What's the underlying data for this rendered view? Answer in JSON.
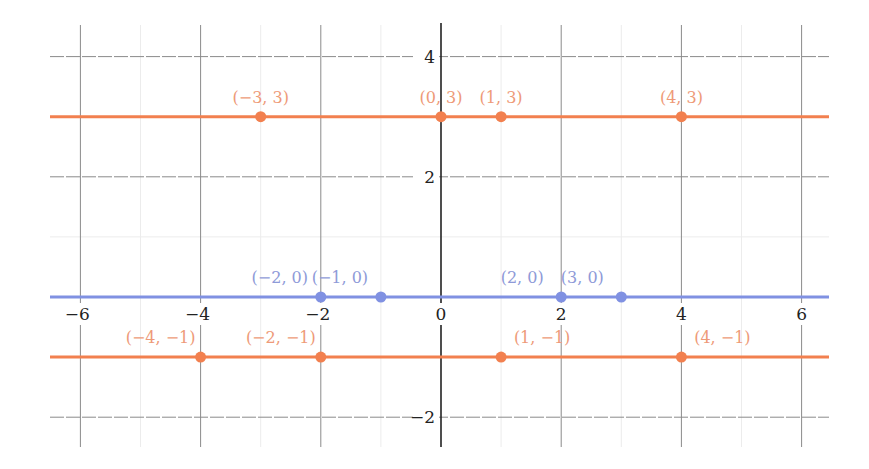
{
  "chart_data": {
    "type": "line",
    "title": "",
    "xlabel": "",
    "ylabel": "",
    "xlim": [
      -6.5,
      6.5
    ],
    "ylim": [
      -2.5,
      4.5
    ],
    "grid": true,
    "x_ticks": [
      -6,
      -4,
      -2,
      0,
      2,
      4,
      6
    ],
    "y_ticks": [
      -2,
      2,
      4
    ],
    "x_tick_labels": [
      "−6",
      "−4",
      "−2",
      "0",
      "2",
      "4",
      "6"
    ],
    "y_tick_labels": [
      "−2",
      "2",
      "4"
    ],
    "colors": {
      "orange": "#F2804F",
      "orange_label": "#EE9A78",
      "blue": "#8091E2",
      "blue_label": "#8E9AD8",
      "grid_major": "#8a8a8a",
      "grid_minor": "#ececec",
      "axis": "#222222"
    },
    "series": [
      {
        "name": "y = 3",
        "color": "orange",
        "y": 3,
        "points": [
          {
            "x": -3,
            "y": 3,
            "label": "(−3, 3)"
          },
          {
            "x": 0,
            "y": 3,
            "label": "(0, 3)"
          },
          {
            "x": 1,
            "y": 3,
            "label": "(1, 3)"
          },
          {
            "x": 4,
            "y": 3,
            "label": "(4, 3)"
          }
        ]
      },
      {
        "name": "y = 0",
        "color": "blue",
        "y": 0,
        "points": [
          {
            "x": -2,
            "y": 0,
            "label": "(−2, 0)"
          },
          {
            "x": -1,
            "y": 0,
            "label": "(−1, 0)"
          },
          {
            "x": 2,
            "y": 0,
            "label": "(2, 0)"
          },
          {
            "x": 3,
            "y": 0,
            "label": "(3, 0)"
          }
        ]
      },
      {
        "name": "y = −1",
        "color": "orange",
        "y": -1,
        "points": [
          {
            "x": -4,
            "y": -1,
            "label": "(−4, −1)"
          },
          {
            "x": -2,
            "y": -1,
            "label": "(−2, −1)"
          },
          {
            "x": 1,
            "y": -1,
            "label": "(1, −1)"
          },
          {
            "x": 4,
            "y": -1,
            "label": "(4, −1)"
          }
        ]
      }
    ]
  }
}
